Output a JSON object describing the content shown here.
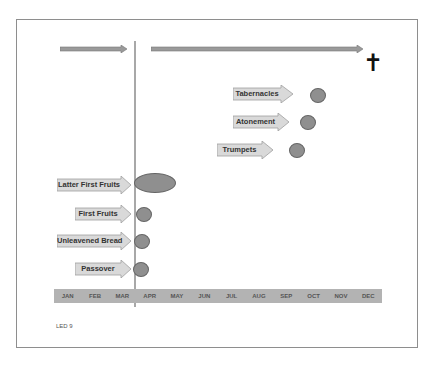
{
  "diagram": {
    "type": "timeline",
    "colors": {
      "frame_border": "#8e8e8e",
      "timeline_arrow_fill": "#9a9a9a",
      "divider_line": "#a8a8a8",
      "label_arrow_fill": "#d9d9d9",
      "label_arrow_border": "#9f9f9f",
      "dot_fill": "#8f8f8f",
      "dot_border": "#666666",
      "month_bar": "#b3b3b3"
    },
    "top_arrows": [
      {
        "name": "before-arrow",
        "from_month": "JAN",
        "to_month": "MAR"
      },
      {
        "name": "after-arrow",
        "from_month": "APR",
        "to_month": "DEC",
        "end_symbol": "cross"
      }
    ],
    "cross_symbol": "✝",
    "months": [
      "JAN",
      "FEB",
      "MAR",
      "APR",
      "MAY",
      "JUN",
      "JUL",
      "AUG",
      "SEP",
      "OCT",
      "NOV",
      "DEC"
    ],
    "spring_feasts": [
      {
        "label": "Latter First Fruits",
        "month": "APR",
        "shape": "oval"
      },
      {
        "label": "First Fruits",
        "month": "APR",
        "shape": "circle"
      },
      {
        "label": "Unleavened Bread",
        "month": "APR",
        "shape": "circle"
      },
      {
        "label": "Passover",
        "month": "APR",
        "shape": "circle"
      }
    ],
    "fall_feasts": [
      {
        "label": "Tabernacles",
        "month": "OCT",
        "shape": "circle"
      },
      {
        "label": "Atonement",
        "month": "OCT",
        "shape": "circle"
      },
      {
        "label": "Trumpets",
        "month": "SEP",
        "shape": "circle"
      }
    ],
    "footer_note": "LED 9"
  }
}
